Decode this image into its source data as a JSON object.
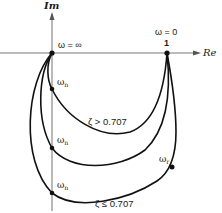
{
  "axes": {
    "imag_label": "Im",
    "real_label": "Re"
  },
  "points": {
    "origin_label": "ω = ∞",
    "unity_value": "1",
    "unity_label": "ω = 0",
    "omega_n_label": "ω",
    "omega_n_sub": "n",
    "omega_r_label": "ω",
    "omega_r_sub": "r"
  },
  "annotations": {
    "zeta_high": "ζ > 0.707",
    "zeta_low": "ζ ≤ 0.707"
  },
  "colors": {
    "curve": "#111111",
    "axis": "#888888",
    "text": "#1a1a1a"
  }
}
